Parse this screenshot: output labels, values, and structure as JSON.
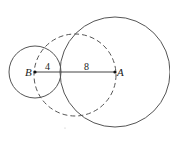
{
  "diagram": {
    "points": [
      {
        "id": "A",
        "label": "A",
        "x": 115,
        "y": 72
      },
      {
        "id": "B",
        "label": "B",
        "x": 35,
        "y": 72
      }
    ],
    "segments": [
      {
        "from": "B",
        "to": "A",
        "sublabels": [
          {
            "text": "4",
            "x": 48,
            "y": 70
          },
          {
            "text": "8",
            "x": 88,
            "y": 70
          }
        ]
      }
    ],
    "circles": [
      {
        "name": "circle-A",
        "cx": 115,
        "cy": 72,
        "r": 55,
        "style": "solid"
      },
      {
        "name": "circle-B",
        "cx": 35,
        "cy": 72,
        "r": 26,
        "style": "solid"
      },
      {
        "name": "circle-dashed",
        "cx": 75,
        "cy": 75,
        "r": 41,
        "style": "dashed"
      }
    ],
    "colors": {
      "stroke": "#555555",
      "text": "#222222"
    }
  }
}
